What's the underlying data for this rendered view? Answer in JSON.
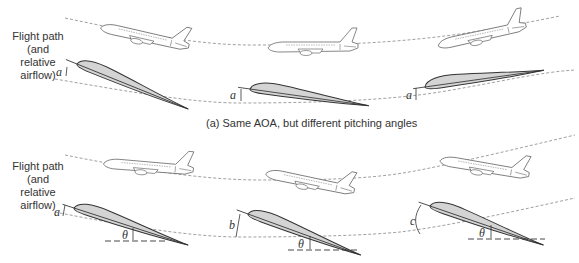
{
  "panel_a": {
    "side_label_line1": "Flight path",
    "side_label_line2": "(and relative",
    "side_label_line3": "airflow)",
    "caption": "(a) Same AOA, but different pitching angles",
    "angle_labels": [
      "a",
      "a",
      "a"
    ],
    "airplanes": [
      {
        "position": "left",
        "attitude": "nose-down descent"
      },
      {
        "position": "center",
        "attitude": "level"
      },
      {
        "position": "right",
        "attitude": "climbing"
      }
    ]
  },
  "panel_b": {
    "side_label_line1": "Flight path",
    "side_label_line2": "(and relative",
    "side_label_line3": "airflow)",
    "angle_labels": [
      "a",
      "b",
      "c"
    ],
    "pitch_angle_labels": [
      "θ",
      "θ",
      "θ"
    ],
    "airplanes": [
      {
        "position": "left",
        "attitude": "nose-up, descending path"
      },
      {
        "position": "center",
        "attitude": "nose-up, level path"
      },
      {
        "position": "right",
        "attitude": "nose-up, climbing path"
      }
    ]
  },
  "colors": {
    "line": "#333333",
    "airfoil_fill": "#d4d4d4",
    "dashed": "#888888"
  }
}
